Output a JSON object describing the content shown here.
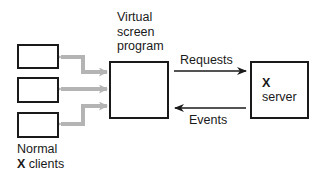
{
  "diagram": {
    "type": "block-diagram",
    "nodes": [
      {
        "id": "client-1",
        "label": ""
      },
      {
        "id": "client-2",
        "label": ""
      },
      {
        "id": "client-3",
        "label": ""
      },
      {
        "id": "virtual-screen-program",
        "label": "Virtual screen program"
      },
      {
        "id": "x-server",
        "label": "X server"
      }
    ],
    "edges": [
      {
        "from": "client-1",
        "to": "virtual-screen-program",
        "style": "gray-bidirectional"
      },
      {
        "from": "client-2",
        "to": "virtual-screen-program",
        "style": "gray-bidirectional"
      },
      {
        "from": "client-3",
        "to": "virtual-screen-program",
        "style": "gray-bidirectional"
      },
      {
        "from": "virtual-screen-program",
        "to": "x-server",
        "label": "Requests"
      },
      {
        "from": "x-server",
        "to": "virtual-screen-program",
        "label": "Events"
      }
    ]
  },
  "labels": {
    "virtual_line1": "Virtual",
    "virtual_line2": "screen",
    "virtual_line3": "program",
    "requests": "Requests",
    "events": "Events",
    "server_x": "X",
    "server_word": "server",
    "clients_line1": "Normal",
    "clients_x": "X",
    "clients_word": " clients"
  },
  "colors": {
    "line": "#1a1a1a",
    "gray_arrow": "#b4b4b4"
  }
}
